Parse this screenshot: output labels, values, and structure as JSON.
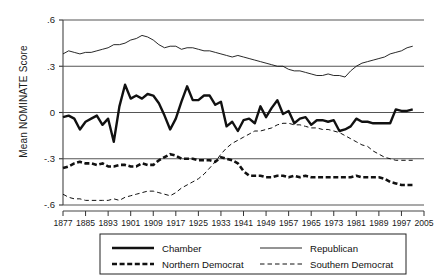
{
  "chart_data": {
    "type": "line",
    "title": "",
    "xlabel": "",
    "ylabel": "Mean NOMINATE Score",
    "xlim": [
      1877,
      2005
    ],
    "ylim": [
      -0.6,
      0.6
    ],
    "grid": true,
    "gridlines_y": [
      0.6,
      0.3,
      0.0,
      -0.3,
      -0.6
    ],
    "ytick_labels": [
      ".6",
      ".3",
      "0",
      "-.3",
      "-.6"
    ],
    "ytick_values": [
      0.6,
      0.3,
      0,
      -0.3,
      -0.6
    ],
    "xtick_labels": [
      "1877",
      "1885",
      "1893",
      "1901",
      "1909",
      "1917",
      "1925",
      "1933",
      "1941",
      "1949",
      "1957",
      "1965",
      "1973",
      "1981",
      "1989",
      "1997",
      "2005"
    ],
    "xtick_values": [
      1877,
      1885,
      1893,
      1901,
      1909,
      1917,
      1925,
      1933,
      1941,
      1949,
      1957,
      1965,
      1973,
      1981,
      1989,
      1997,
      2005
    ],
    "legend_position": "bottom",
    "series": [
      {
        "name": "Chamber",
        "style": "thick-solid",
        "x": [
          1877,
          1879,
          1881,
          1883,
          1885,
          1887,
          1889,
          1891,
          1893,
          1895,
          1897,
          1899,
          1901,
          1903,
          1905,
          1907,
          1909,
          1911,
          1913,
          1915,
          1917,
          1919,
          1921,
          1923,
          1925,
          1927,
          1929,
          1931,
          1933,
          1935,
          1937,
          1939,
          1941,
          1943,
          1945,
          1947,
          1949,
          1951,
          1953,
          1955,
          1957,
          1959,
          1961,
          1963,
          1965,
          1967,
          1969,
          1971,
          1973,
          1975,
          1977,
          1979,
          1981,
          1983,
          1985,
          1987,
          1989,
          1991,
          1993,
          1995,
          1997,
          1999,
          2001
        ],
        "values": [
          -0.03,
          -0.02,
          -0.04,
          -0.11,
          -0.06,
          -0.04,
          -0.02,
          -0.08,
          -0.04,
          -0.19,
          0.04,
          0.18,
          0.09,
          0.11,
          0.09,
          0.12,
          0.11,
          0.06,
          -0.02,
          -0.11,
          -0.04,
          0.07,
          0.17,
          0.08,
          0.08,
          0.11,
          0.11,
          0.05,
          0.07,
          -0.09,
          -0.06,
          -0.12,
          -0.05,
          -0.04,
          -0.07,
          0.04,
          -0.03,
          0.03,
          0.08,
          -0.01,
          0.01,
          -0.07,
          -0.04,
          -0.03,
          -0.08,
          -0.05,
          -0.05,
          -0.06,
          -0.05,
          -0.12,
          -0.11,
          -0.09,
          -0.04,
          -0.06,
          -0.06,
          -0.07,
          -0.07,
          -0.07,
          -0.07,
          0.02,
          0.01,
          0.01,
          0.02
        ]
      },
      {
        "name": "Republican",
        "style": "thin-solid",
        "x": [
          1877,
          1879,
          1881,
          1883,
          1885,
          1887,
          1889,
          1891,
          1893,
          1895,
          1897,
          1899,
          1901,
          1903,
          1905,
          1907,
          1909,
          1911,
          1913,
          1915,
          1917,
          1919,
          1921,
          1923,
          1925,
          1927,
          1929,
          1931,
          1933,
          1935,
          1937,
          1939,
          1941,
          1943,
          1945,
          1947,
          1949,
          1951,
          1953,
          1955,
          1957,
          1959,
          1961,
          1963,
          1965,
          1967,
          1969,
          1971,
          1973,
          1975,
          1977,
          1979,
          1981,
          1983,
          1985,
          1987,
          1989,
          1991,
          1993,
          1995,
          1997,
          1999,
          2001
        ],
        "values": [
          0.38,
          0.4,
          0.39,
          0.38,
          0.39,
          0.39,
          0.4,
          0.41,
          0.42,
          0.44,
          0.44,
          0.45,
          0.47,
          0.48,
          0.5,
          0.49,
          0.47,
          0.44,
          0.42,
          0.43,
          0.43,
          0.41,
          0.42,
          0.42,
          0.41,
          0.4,
          0.4,
          0.39,
          0.38,
          0.37,
          0.36,
          0.37,
          0.36,
          0.35,
          0.34,
          0.33,
          0.32,
          0.31,
          0.3,
          0.3,
          0.28,
          0.27,
          0.27,
          0.26,
          0.25,
          0.24,
          0.24,
          0.25,
          0.24,
          0.24,
          0.23,
          0.27,
          0.3,
          0.32,
          0.33,
          0.34,
          0.35,
          0.36,
          0.38,
          0.39,
          0.4,
          0.42,
          0.43
        ]
      },
      {
        "name": "Northern Democrat",
        "style": "thick-dashed",
        "x": [
          1877,
          1879,
          1881,
          1883,
          1885,
          1887,
          1889,
          1891,
          1893,
          1895,
          1897,
          1899,
          1901,
          1903,
          1905,
          1907,
          1909,
          1911,
          1913,
          1915,
          1917,
          1919,
          1921,
          1923,
          1925,
          1927,
          1929,
          1931,
          1933,
          1935,
          1937,
          1939,
          1941,
          1943,
          1945,
          1947,
          1949,
          1951,
          1953,
          1955,
          1957,
          1959,
          1961,
          1963,
          1965,
          1967,
          1969,
          1971,
          1973,
          1975,
          1977,
          1979,
          1981,
          1983,
          1985,
          1987,
          1989,
          1991,
          1993,
          1995,
          1997,
          1999,
          2001
        ],
        "values": [
          -0.36,
          -0.35,
          -0.33,
          -0.32,
          -0.33,
          -0.33,
          -0.34,
          -0.33,
          -0.35,
          -0.35,
          -0.34,
          -0.34,
          -0.35,
          -0.35,
          -0.33,
          -0.34,
          -0.34,
          -0.31,
          -0.29,
          -0.27,
          -0.28,
          -0.3,
          -0.3,
          -0.3,
          -0.31,
          -0.31,
          -0.31,
          -0.32,
          -0.29,
          -0.3,
          -0.31,
          -0.33,
          -0.38,
          -0.41,
          -0.41,
          -0.41,
          -0.42,
          -0.42,
          -0.41,
          -0.41,
          -0.42,
          -0.41,
          -0.42,
          -0.41,
          -0.42,
          -0.42,
          -0.42,
          -0.42,
          -0.42,
          -0.42,
          -0.42,
          -0.42,
          -0.41,
          -0.42,
          -0.42,
          -0.42,
          -0.42,
          -0.43,
          -0.45,
          -0.46,
          -0.47,
          -0.47,
          -0.47
        ]
      },
      {
        "name": "Southern Democrat",
        "style": "thin-dashed",
        "x": [
          1877,
          1879,
          1881,
          1883,
          1885,
          1887,
          1889,
          1891,
          1893,
          1895,
          1897,
          1899,
          1901,
          1903,
          1905,
          1907,
          1909,
          1911,
          1913,
          1915,
          1917,
          1919,
          1921,
          1923,
          1925,
          1927,
          1929,
          1931,
          1933,
          1935,
          1937,
          1939,
          1941,
          1943,
          1945,
          1947,
          1949,
          1951,
          1953,
          1955,
          1957,
          1959,
          1961,
          1963,
          1965,
          1967,
          1969,
          1971,
          1973,
          1975,
          1977,
          1979,
          1981,
          1983,
          1985,
          1987,
          1989,
          1991,
          1993,
          1995,
          1997,
          1999,
          2001
        ],
        "values": [
          -0.53,
          -0.55,
          -0.56,
          -0.56,
          -0.57,
          -0.57,
          -0.57,
          -0.57,
          -0.57,
          -0.56,
          -0.57,
          -0.55,
          -0.54,
          -0.53,
          -0.52,
          -0.51,
          -0.51,
          -0.52,
          -0.53,
          -0.54,
          -0.52,
          -0.49,
          -0.47,
          -0.45,
          -0.43,
          -0.4,
          -0.36,
          -0.32,
          -0.27,
          -0.23,
          -0.2,
          -0.18,
          -0.16,
          -0.14,
          -0.12,
          -0.12,
          -0.11,
          -0.1,
          -0.08,
          -0.07,
          -0.07,
          -0.08,
          -0.08,
          -0.09,
          -0.1,
          -0.1,
          -0.11,
          -0.11,
          -0.12,
          -0.13,
          -0.15,
          -0.17,
          -0.19,
          -0.21,
          -0.22,
          -0.25,
          -0.27,
          -0.29,
          -0.3,
          -0.31,
          -0.31,
          -0.31,
          -0.31
        ]
      }
    ]
  },
  "legend": {
    "entries": [
      {
        "label": "Chamber",
        "style": "thick-solid"
      },
      {
        "label": "Republican",
        "style": "thin-solid"
      },
      {
        "label": "Northern Democrat",
        "style": "thick-dashed"
      },
      {
        "label": "Southern Democrat",
        "style": "thin-dashed"
      }
    ]
  },
  "colors": {
    "ink": "#111111",
    "axis": "#444444",
    "background": "#ffffff"
  }
}
